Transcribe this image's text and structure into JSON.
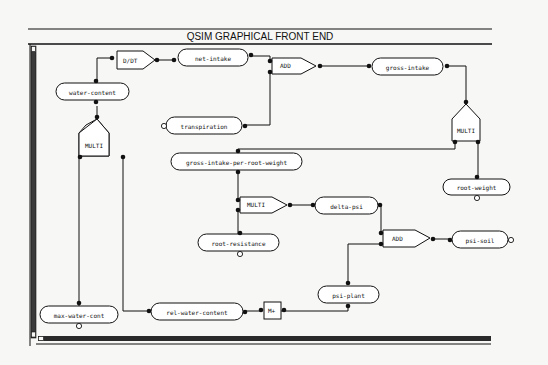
{
  "window": {
    "title": "QSIM GRAPHICAL  FRONT END"
  },
  "colors": {
    "background": "#f7f7f5",
    "ink": "#111111"
  },
  "diagram": {
    "variables": [
      {
        "id": "water-content",
        "label": "water-content"
      },
      {
        "id": "net-intake",
        "label": "net-intake"
      },
      {
        "id": "gross-intake",
        "label": "gross-intake"
      },
      {
        "id": "transpiration",
        "label": "transpiration"
      },
      {
        "id": "gross-intake-per-root-weight",
        "label": "gross-intake-per-root-weight"
      },
      {
        "id": "root-weight",
        "label": "root-weight"
      },
      {
        "id": "delta-psi",
        "label": "delta-psi"
      },
      {
        "id": "root-resistance",
        "label": "root-resistance"
      },
      {
        "id": "psi-soil",
        "label": "psi-soil"
      },
      {
        "id": "psi-plant",
        "label": "psi-plant"
      },
      {
        "id": "max-water-cont",
        "label": "max-water-cont"
      },
      {
        "id": "rel-water-content",
        "label": "rel-water-content"
      }
    ],
    "operators": [
      {
        "id": "d-dt",
        "label": "D/DT"
      },
      {
        "id": "add-1",
        "label": "ADD"
      },
      {
        "id": "multi-1",
        "label": "MULTI"
      },
      {
        "id": "multi-2",
        "label": "MULTI"
      },
      {
        "id": "multi-3",
        "label": "MULTI"
      },
      {
        "id": "add-2",
        "label": "ADD"
      },
      {
        "id": "m-plus",
        "label": "M+"
      }
    ]
  }
}
